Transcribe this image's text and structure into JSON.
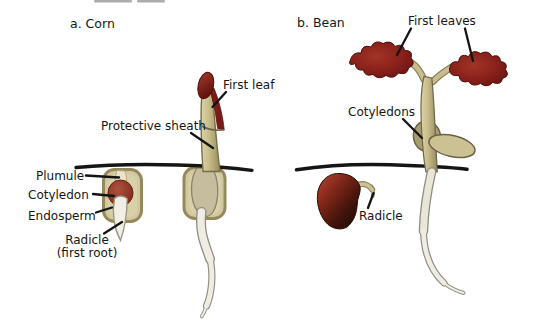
{
  "figure": {
    "corn": {
      "title": "a. Corn",
      "labels": {
        "first_leaf": "First leaf",
        "protective_sheath": "Protective sheath",
        "plumule": "Plumule",
        "cotyledon": "Cotyledon",
        "endosperm": "Endosperm",
        "radicle": "Radicle",
        "radicle_sub": "(first root)"
      }
    },
    "bean": {
      "title": "b. Bean",
      "labels": {
        "first_leaves": "First leaves",
        "cotyledons": "Cotyledons",
        "radicle": "Radicle"
      }
    },
    "colors": {
      "background": "#ffffff",
      "text": "#151515",
      "soil_line": "#151515",
      "leaf_dark_red": "#88201a",
      "stem_tan": "#c6ba88",
      "seed_coat_tan": "#d2c9a2",
      "seed_rim_olive": "#95895c",
      "cotyledon_red_brown": "#7a2316",
      "bean_seed_dark": "#4a150c",
      "root_white": "#eeece3"
    }
  }
}
